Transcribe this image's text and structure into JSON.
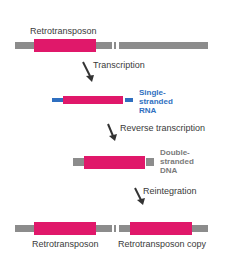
{
  "diagram": {
    "title_top": "Retrotransposon",
    "steps": [
      {
        "label": "Transcription"
      },
      {
        "label": "Reverse transcription"
      },
      {
        "label": "Reintegration"
      }
    ],
    "rna_label": {
      "line1": "Single-",
      "line2": "stranded",
      "line3": "RNA"
    },
    "dna_label": {
      "line1": "Double-",
      "line2": "stranded",
      "line3": "DNA"
    },
    "bottom_labels": {
      "left": "Retrotransposon",
      "right": "Retrotransposon copy"
    },
    "colors": {
      "retrotransposon": "#e0186a",
      "chromosome": "#8c8c8c",
      "rna": "#2f6fc0",
      "arrow": "#333333"
    }
  }
}
